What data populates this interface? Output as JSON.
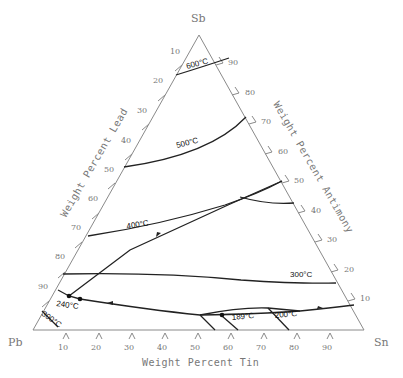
{
  "diagram": {
    "type": "ternary phase diagram (liquidus projection)",
    "corners": {
      "top": "Sb",
      "left": "Pb",
      "right": "Sn"
    },
    "axes": {
      "left": {
        "title": "Weight Percent Lead",
        "ticks": [
          "10",
          "20",
          "30",
          "40",
          "50",
          "60",
          "70",
          "80",
          "90"
        ]
      },
      "right": {
        "title": "Weight Percent Antimony",
        "ticks": [
          "90",
          "80",
          "70",
          "60",
          "50",
          "40",
          "30",
          "20",
          "10"
        ]
      },
      "bottom": {
        "title": "Weight Percent Tin",
        "ticks": [
          "10",
          "20",
          "30",
          "40",
          "50",
          "60",
          "70",
          "80",
          "90"
        ]
      }
    },
    "isotherms": [
      {
        "label": "600°C"
      },
      {
        "label": "500°C"
      },
      {
        "label": "400°C"
      },
      {
        "label": "300°C"
      },
      {
        "label": "240°C"
      },
      {
        "label": "300°C"
      },
      {
        "label": "189°C"
      },
      {
        "label": "200°C"
      }
    ]
  }
}
